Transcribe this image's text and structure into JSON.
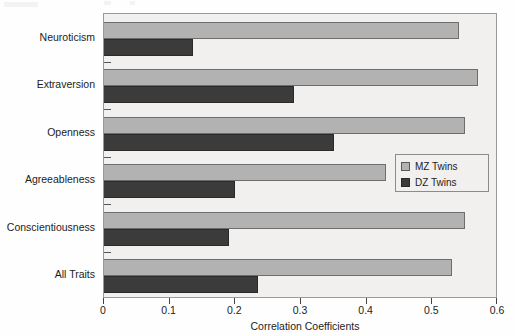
{
  "chart_data": {
    "type": "bar",
    "orientation": "horizontal",
    "title": "",
    "xlabel": "Correlation Coefficients",
    "ylabel": "",
    "xlim": [
      0,
      0.6
    ],
    "xticks": [
      "0",
      "0.1",
      "0.2",
      "0.3",
      "0.4",
      "0.5",
      "0.6"
    ],
    "xtick_values": [
      0,
      0.1,
      0.2,
      0.3,
      0.4,
      0.5,
      0.6
    ],
    "grid": false,
    "legend_position": "right-middle",
    "categories": [
      "Neuroticism",
      "Extraversion",
      "Openness",
      "Agreeableness",
      "Conscientiousness",
      "All Traits"
    ],
    "series": [
      {
        "name": "MZ Twins",
        "color": "#b2b2b2",
        "values": [
          0.54,
          0.57,
          0.55,
          0.43,
          0.55,
          0.53
        ]
      },
      {
        "name": "DZ Twins",
        "color": "#3b3b3b",
        "values": [
          0.135,
          0.29,
          0.35,
          0.2,
          0.19,
          0.235
        ]
      }
    ]
  },
  "legend": {
    "items": [
      {
        "label": "MZ Twins",
        "swatch": "mz"
      },
      {
        "label": "DZ Twins",
        "swatch": "dz"
      }
    ]
  },
  "axis": {
    "x_title": "Correlation Coefficients"
  },
  "colors": {
    "mz": "#b2b2b2",
    "dz": "#3b3b3b",
    "plot_background": "#f1f0ee",
    "frame": "#9a9a9a"
  }
}
